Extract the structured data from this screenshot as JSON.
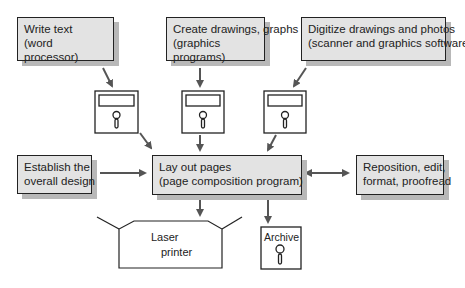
{
  "boxes": {
    "write_text": {
      "line1": "Write text",
      "line2": "(word processor)"
    },
    "create_drawings": {
      "line1": "Create drawings, graphs",
      "line2": "(graphics programs)"
    },
    "digitize": {
      "line1": "Digitize drawings and photos",
      "line2": "(scanner and graphics software)"
    },
    "establish": {
      "line1": "Establish the",
      "line2": "overall design"
    },
    "layout": {
      "line1": "Lay out pages",
      "line2": "(page composition program)"
    },
    "reposition": {
      "line1": "Reposition, edit,",
      "line2": "format, proofread"
    }
  },
  "printer": {
    "line1": "Laser",
    "line2": "printer"
  },
  "archive": {
    "label": "Archive"
  },
  "colors": {
    "box_fill": "#e3e3e3",
    "shadow": "#b8b8b8",
    "arrow": "#555555",
    "stroke": "#222222"
  }
}
